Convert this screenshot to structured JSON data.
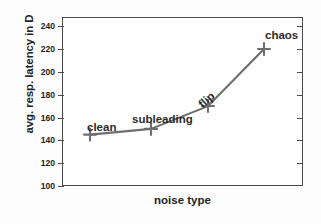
{
  "chart_data": {
    "type": "line",
    "title": "",
    "xlabel": "noise type",
    "ylabel": "avg. resp. latency in D",
    "categories": [
      "clean",
      "subleading",
      "flip",
      "chaos"
    ],
    "values": [
      145,
      150,
      170,
      220
    ],
    "point_labels": [
      "clean",
      "subleading",
      "flip",
      "chaos"
    ],
    "ylim": [
      100,
      248
    ],
    "yticks": [
      100,
      120,
      140,
      160,
      180,
      200,
      220,
      240
    ],
    "ytick_labels": [
      "100",
      "120",
      "140",
      "160",
      "180",
      "200",
      "220",
      "240"
    ],
    "xticks": [],
    "xtick_labels": [],
    "grid": false,
    "legend": false,
    "marker": "plus",
    "line_color": "#6e6e6e",
    "marker_color": "#6e6e6e",
    "axis_color": "#4a4a4a",
    "text_color": "#242424",
    "background": "#ffffff"
  },
  "axes": {
    "y_label": "avg. resp. latency in D",
    "x_label": "noise type",
    "y_ticks": [
      {
        "value": 240,
        "label": "240"
      },
      {
        "value": 220,
        "label": "220"
      },
      {
        "value": 200,
        "label": "200"
      },
      {
        "value": 180,
        "label": "180"
      },
      {
        "value": 160,
        "label": "160"
      },
      {
        "value": 140,
        "label": "140"
      },
      {
        "value": 120,
        "label": "120"
      },
      {
        "value": 100,
        "label": "100"
      }
    ]
  },
  "annotations": [
    {
      "name": "clean",
      "text": "clean",
      "value": 145
    },
    {
      "name": "subleading",
      "text": "subleading",
      "value": 150
    },
    {
      "name": "flip",
      "text": "flip",
      "value": 170
    },
    {
      "name": "chaos",
      "text": "chaos",
      "value": 220
    }
  ]
}
